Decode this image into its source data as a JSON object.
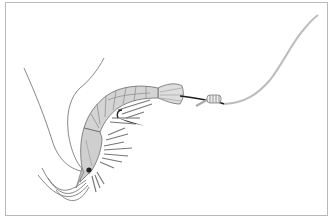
{
  "illustration": {
    "subject": "shrimp bait on fishing hook",
    "elements": [
      "shrimp",
      "fishing-hook",
      "knot",
      "fishing-line"
    ],
    "colors": {
      "background": "#ffffff",
      "frame": "#b8b8b8",
      "shrimp_body": "#d4d4d4",
      "shrimp_outline": "#6a6a6a",
      "antenna": "#7a7a7a",
      "hook": "#1e1e1e",
      "line": "#bdbdbd",
      "eye": "#222222"
    }
  }
}
